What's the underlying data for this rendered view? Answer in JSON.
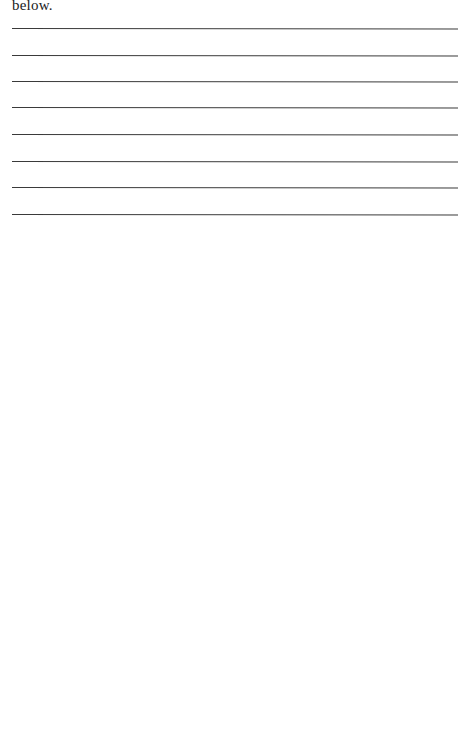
{
  "document": {
    "lead_text": "below.",
    "answer_lines": {
      "count": 8,
      "positions_y": [
        28,
        55,
        81,
        107,
        134,
        161,
        187,
        214
      ],
      "color": "#3a3a3a"
    }
  }
}
